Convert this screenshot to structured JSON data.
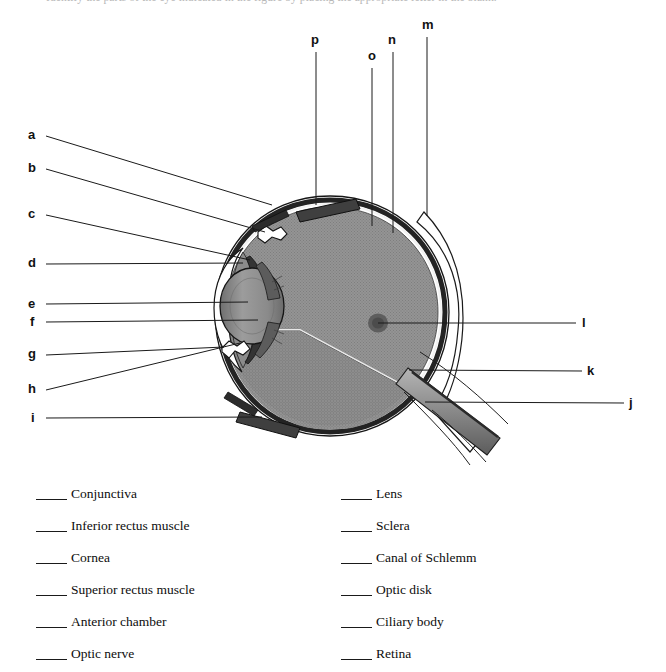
{
  "header": {
    "clipped_text": "Identify the parts of the eye indicated in the figure by placing the appropriate letter in the blank."
  },
  "diagram": {
    "callouts_left": [
      {
        "letter": "a",
        "x": 31,
        "y": 135,
        "line_to_x": 272,
        "line_to_y": 205
      },
      {
        "letter": "b",
        "x": 31,
        "y": 168,
        "line_to_x": 265,
        "line_to_y": 232
      },
      {
        "letter": "c",
        "x": 31,
        "y": 214,
        "line_to_x": 250,
        "line_to_y": 260
      },
      {
        "letter": "d",
        "x": 31,
        "y": 264,
        "line_to_x": 243,
        "line_to_y": 263
      },
      {
        "letter": "e",
        "x": 31,
        "y": 304,
        "line_to_x": 248,
        "line_to_y": 302
      },
      {
        "letter": "f",
        "x": 32,
        "y": 322,
        "line_to_x": 258,
        "line_to_y": 320
      },
      {
        "letter": "g",
        "x": 31,
        "y": 354,
        "line_to_x": 224,
        "line_to_y": 347
      },
      {
        "letter": "h",
        "x": 31,
        "y": 389,
        "line_to_x": 240,
        "line_to_y": 343
      },
      {
        "letter": "i",
        "x": 33,
        "y": 418,
        "line_to_x": 262,
        "line_to_y": 417
      }
    ],
    "callouts_right": [
      {
        "letter": "j",
        "x": 631,
        "y": 403,
        "line_to_x": 425,
        "line_to_y": 402
      },
      {
        "letter": "k",
        "x": 589,
        "y": 371,
        "line_to_x": 409,
        "line_to_y": 370
      },
      {
        "letter": "l",
        "x": 583,
        "y": 323,
        "line_to_x": 378,
        "line_to_y": 323
      }
    ],
    "callouts_top": [
      {
        "letter": "m",
        "x": 424,
        "y": 25,
        "line_x": 427,
        "line_to_y": 216
      },
      {
        "letter": "n",
        "x": 390,
        "y": 40,
        "line_x": 393,
        "line_to_y": 233
      },
      {
        "letter": "o",
        "x": 369,
        "y": 56,
        "line_x": 372,
        "line_to_y": 226
      },
      {
        "letter": "p",
        "x": 313,
        "y": 40,
        "line_x": 316,
        "line_to_y": 205
      }
    ],
    "colors": {
      "outline": "#111111",
      "vitreous": "#8f8f8f",
      "lens": "#8c8c8c",
      "sclera_white": "#ffffff",
      "choroid_dark": "#1d1d1d",
      "muscle": "#4a4a4a",
      "optic_nerve": "#8a8a8a",
      "optic_disk_spot": "#5e5e5e",
      "leader_line": "#1a1a1a"
    }
  },
  "answers": {
    "left_column": [
      {
        "blank": "",
        "label": "Conjunctiva"
      },
      {
        "blank": "",
        "label": "Inferior rectus muscle"
      },
      {
        "blank": "",
        "label": "Cornea"
      },
      {
        "blank": "",
        "label": "Superior rectus muscle"
      },
      {
        "blank": "",
        "label": "Anterior chamber"
      },
      {
        "blank": "",
        "label": "Optic nerve"
      }
    ],
    "right_column": [
      {
        "blank": "",
        "label": "Lens"
      },
      {
        "blank": "",
        "label": "Sclera"
      },
      {
        "blank": "",
        "label": "Canal of Schlemm"
      },
      {
        "blank": "",
        "label": "Optic disk"
      },
      {
        "blank": "",
        "label": "Ciliary body"
      },
      {
        "blank": "",
        "label": "Retina"
      }
    ]
  }
}
